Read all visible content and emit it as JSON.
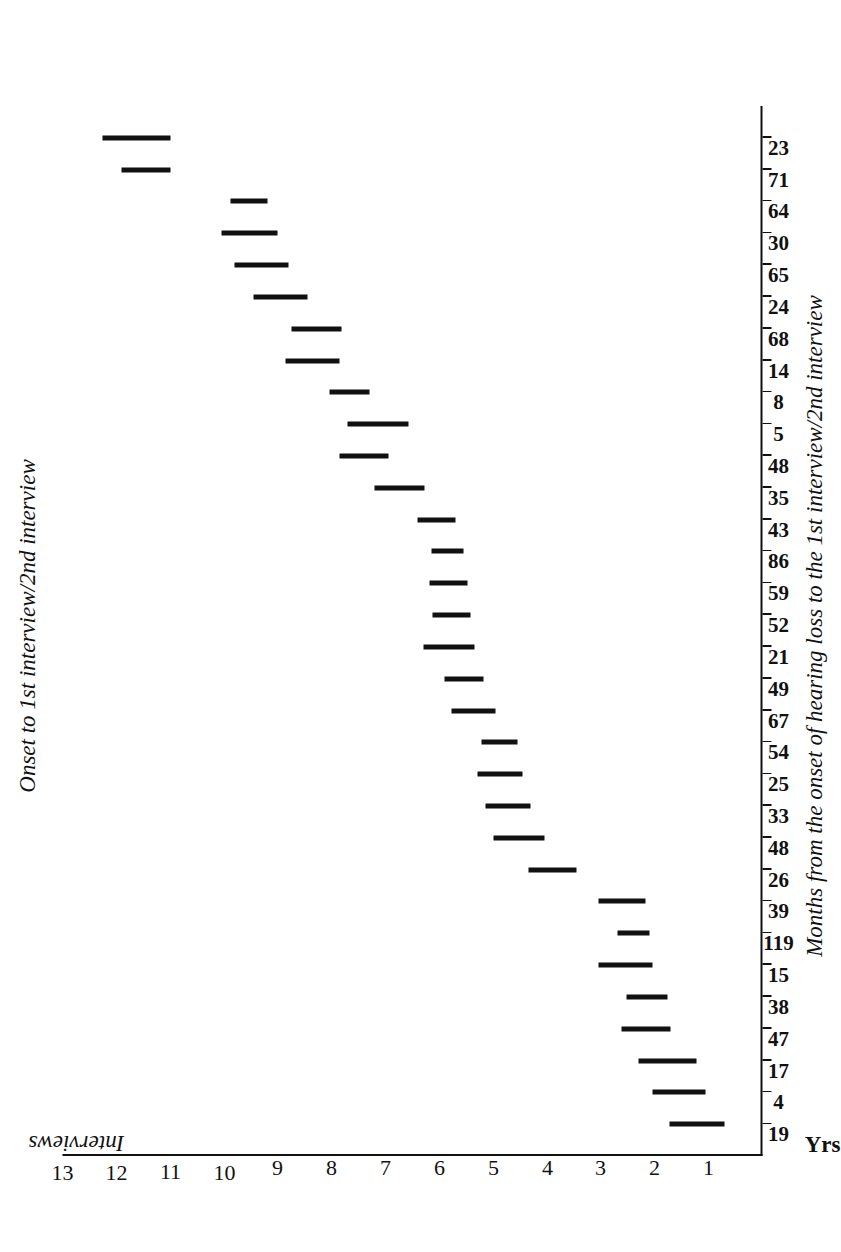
{
  "chart_data": {
    "type": "bar",
    "title": "Onset to 1st interview/2nd interview",
    "subtitle": "",
    "xlabel": "Interviews",
    "ylabel": "Months from the onset of hearing loss to the 1st interview/2nd interview",
    "unit_label": "Yrs.",
    "orientation": "range-bars (printed sideways / landscape plate)",
    "grid": false,
    "legend": null,
    "ylim": [
      0,
      13
    ],
    "yticks": [
      1,
      2,
      3,
      4,
      5,
      6,
      7,
      8,
      9,
      10,
      11,
      12,
      13
    ],
    "ytick_labels": [
      "1",
      "2",
      "3",
      "4",
      "5",
      "6",
      "7",
      "8",
      "9",
      "10",
      "11",
      "12",
      "13"
    ],
    "categories": [
      "19",
      "4",
      "17",
      "47",
      "38",
      "15",
      "119",
      "39",
      "26",
      "48",
      "33",
      "25",
      "54",
      "67",
      "49",
      "21",
      "52",
      "59",
      "86",
      "43",
      "35",
      "48",
      "5",
      "8",
      "14",
      "68",
      "24",
      "65",
      "30",
      "64",
      "71",
      "23"
    ],
    "series": [
      {
        "name": "Onset to 1st interview / 2nd interview",
        "type": "range",
        "values": [
          {
            "category": "19",
            "start": 0.7,
            "end": 1.72
          },
          {
            "category": "4",
            "start": 1.05,
            "end": 2.05
          },
          {
            "category": "17",
            "start": 1.22,
            "end": 2.3
          },
          {
            "category": "47",
            "start": 1.7,
            "end": 2.62
          },
          {
            "category": "38",
            "start": 1.76,
            "end": 2.52
          },
          {
            "category": "15",
            "start": 2.05,
            "end": 3.05
          },
          {
            "category": "119",
            "start": 2.1,
            "end": 2.7
          },
          {
            "category": "39",
            "start": 2.18,
            "end": 3.05
          },
          {
            "category": "26",
            "start": 3.45,
            "end": 4.35
          },
          {
            "category": "48",
            "start": 4.05,
            "end": 5.0
          },
          {
            "category": "33",
            "start": 4.3,
            "end": 5.15
          },
          {
            "category": "25",
            "start": 4.45,
            "end": 5.3
          },
          {
            "category": "54",
            "start": 4.55,
            "end": 5.22
          },
          {
            "category": "67",
            "start": 4.95,
            "end": 5.78
          },
          {
            "category": "49",
            "start": 5.18,
            "end": 5.9
          },
          {
            "category": "21",
            "start": 5.35,
            "end": 6.3
          },
          {
            "category": "52",
            "start": 5.42,
            "end": 6.12
          },
          {
            "category": "59",
            "start": 5.48,
            "end": 6.18
          },
          {
            "category": "86",
            "start": 5.55,
            "end": 6.15
          },
          {
            "category": "43",
            "start": 5.7,
            "end": 6.4
          },
          {
            "category": "35",
            "start": 6.28,
            "end": 7.2
          },
          {
            "category": "48",
            "start": 6.95,
            "end": 7.85
          },
          {
            "category": "5",
            "start": 6.58,
            "end": 7.7
          },
          {
            "category": "8",
            "start": 7.3,
            "end": 8.05
          },
          {
            "category": "14",
            "start": 7.85,
            "end": 8.85
          },
          {
            "category": "68",
            "start": 7.82,
            "end": 8.75
          },
          {
            "category": "24",
            "start": 8.45,
            "end": 9.45
          },
          {
            "category": "65",
            "start": 8.8,
            "end": 9.8
          },
          {
            "category": "30",
            "start": 9.0,
            "end": 10.05
          },
          {
            "category": "64",
            "start": 9.2,
            "end": 9.88
          },
          {
            "category": "71",
            "start": 11.0,
            "end": 11.9
          },
          {
            "category": "23",
            "start": 11.0,
            "end": 12.25
          }
        ]
      }
    ]
  },
  "figure": {
    "title": "Onset to 1st interview/2nd interview",
    "category_axis_title": "Interviews",
    "value_axis_title": "Months from the onset of hearing loss to the 1st interview/2nd interview",
    "unit_corner_label": "Yrs.",
    "ink_color": "#111111",
    "paper_color": "#ffffff"
  }
}
